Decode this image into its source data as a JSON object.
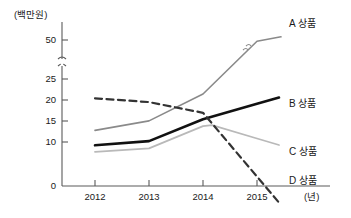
{
  "chart_data": {
    "type": "line",
    "title": "",
    "ylabel": "(백만원)",
    "xlabel": "(년)",
    "x": [
      "2012",
      "2013",
      "2014",
      "2015"
    ],
    "ytick_labels": [
      "0",
      "10",
      "15",
      "20",
      "25",
      "50"
    ],
    "ytick_values": [
      0,
      10,
      15,
      20,
      25,
      50
    ],
    "axis_break": {
      "between": [
        25,
        50
      ],
      "symbol": "≈",
      "note": "y-axis broken between 25 and 50"
    },
    "ylim": [
      0,
      55
    ],
    "grid": false,
    "legend_position": "right-inline",
    "series": [
      {
        "name": "A 상품",
        "label": "A 상품",
        "color": "#8a8a8a",
        "style": "solid",
        "width": 1.6,
        "values": [
          13,
          15.2,
          21.5,
          48
        ],
        "end_extrapolated": 55,
        "has_break_marker": true
      },
      {
        "name": "B 상품",
        "label": "B 상품",
        "color": "#111111",
        "style": "solid",
        "width": 2.6,
        "values": [
          9.5,
          10.5,
          15.6,
          19.2
        ]
      },
      {
        "name": "C 상품",
        "label": "C 상품",
        "color": "#b9b9b9",
        "style": "solid",
        "width": 1.8,
        "values": [
          8,
          8.8,
          14,
          11.1
        ],
        "peak_after_2014": 14.2
      },
      {
        "name": "D 상품",
        "label": "D 상품",
        "color": "#333333",
        "style": "dashed",
        "width": 2.2,
        "values": [
          20.5,
          19.6,
          17.1,
          2.2
        ]
      }
    ]
  },
  "axis": {
    "y_unit_label": "(백만원)",
    "x_unit_label": "(년)",
    "origin_label": "0"
  },
  "colors": {
    "background": "#ffffff",
    "axis": "#5a5a5a",
    "text": "#1a1a1a",
    "series_a": "#8a8a8a",
    "series_b": "#111111",
    "series_c": "#b9b9b9",
    "series_d": "#333333"
  }
}
